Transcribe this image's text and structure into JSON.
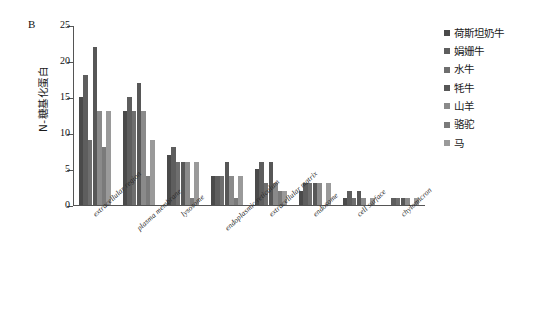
{
  "panel": {
    "letter": "B"
  },
  "chart_data": {
    "type": "bar",
    "title": "",
    "xlabel": "",
    "ylabel": "N-糖基化蛋白",
    "ylim": [
      0,
      25
    ],
    "yticks": [
      0,
      5,
      10,
      15,
      20,
      25
    ],
    "grid": false,
    "legend_position": "right",
    "categories": [
      "extracellular region",
      "plasma membrane",
      "lysosome",
      "endoplasmic reticulum",
      "extracellular matrix",
      "endosome",
      "cell surface",
      "chylomicron"
    ],
    "series": [
      {
        "name": "荷斯坦奶牛",
        "color": "#4a4a4a",
        "values": [
          15,
          13,
          7,
          4,
          5,
          2,
          1,
          0
        ]
      },
      {
        "name": "娟姗牛",
        "color": "#5e5e5e",
        "values": [
          18,
          15,
          8,
          4,
          6,
          3,
          2,
          1
        ]
      },
      {
        "name": "水牛",
        "color": "#6e6e6e",
        "values": [
          9,
          13,
          6,
          4,
          3,
          3,
          1,
          1
        ]
      },
      {
        "name": "牦牛",
        "color": "#575757",
        "values": [
          22,
          17,
          6,
          6,
          6,
          3,
          2,
          1
        ]
      },
      {
        "name": "山羊",
        "color": "#8a8a8a",
        "values": [
          13,
          13,
          6,
          4,
          3,
          3,
          1,
          1
        ]
      },
      {
        "name": "骆驼",
        "color": "#7a7a7a",
        "values": [
          8,
          4,
          1,
          1,
          2,
          0,
          0,
          0
        ]
      },
      {
        "name": "马",
        "color": "#9a9a9a",
        "values": [
          13,
          9,
          6,
          4,
          2,
          3,
          1,
          1
        ]
      }
    ]
  }
}
